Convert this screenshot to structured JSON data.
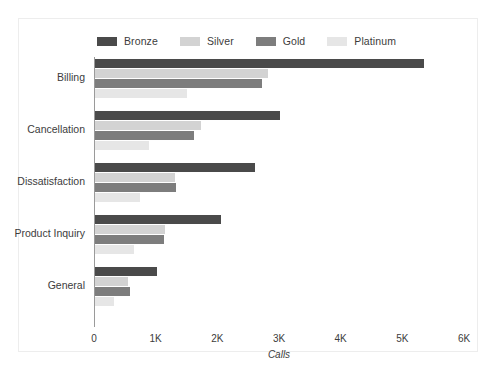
{
  "chart_data": {
    "type": "bar",
    "orientation": "horizontal",
    "title": "",
    "xlabel": "Calls",
    "ylabel": "",
    "xlim": [
      0,
      6000
    ],
    "xticks": [
      0,
      1000,
      2000,
      3000,
      4000,
      5000,
      6000
    ],
    "xtick_labels": [
      "0",
      "1K",
      "2K",
      "3K",
      "4K",
      "5K",
      "6K"
    ],
    "grid": false,
    "legend_position": "top-left",
    "categories": [
      "Billing",
      "Cancellation",
      "Dissatisfaction",
      "Product Inquiry",
      "General"
    ],
    "series": [
      {
        "name": "Bronze",
        "color": "#4a4a4a",
        "values": [
          5340,
          3000,
          2600,
          2050,
          1000
        ]
      },
      {
        "name": "Silver",
        "color": "#d3d3d3",
        "values": [
          2810,
          1720,
          1300,
          1130,
          540
        ]
      },
      {
        "name": "Gold",
        "color": "#7d7d7d",
        "values": [
          2700,
          1610,
          1320,
          1120,
          570
        ]
      },
      {
        "name": "Platinum",
        "color": "#e6e6e6",
        "values": [
          1490,
          880,
          730,
          630,
          310
        ]
      }
    ]
  },
  "colors": {
    "bronze": "#4a4a4a",
    "silver": "#d3d3d3",
    "gold": "#7d7d7d",
    "platinum": "#e6e6e6",
    "axis": "#9a9a9a",
    "border": "#ededed",
    "text": "#3c3c3c",
    "background": "#ffffff"
  }
}
